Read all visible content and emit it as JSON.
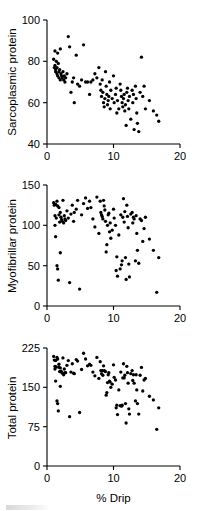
{
  "figure": {
    "name": "drip-vs-protein-scatter-figure",
    "panel_count": 3
  },
  "chart_data": [
    {
      "type": "scatter",
      "title": "",
      "xlabel": "",
      "ylabel": "Sarcoplasmic protein",
      "xlim": [
        0,
        20
      ],
      "ylim": [
        40,
        100
      ],
      "xticks": [
        0,
        10,
        20
      ],
      "yticks": [
        40,
        60,
        80,
        100
      ],
      "xticklabels": [
        "0",
        "10",
        "20"
      ],
      "yticklabels": [
        "40",
        "60",
        "80",
        "100"
      ],
      "grid": false,
      "legend": null,
      "marker": "filled-circle",
      "marker_color": "#000000",
      "n_points": 104,
      "x": [
        1.0,
        1.1,
        1.2,
        1.2,
        1.3,
        1.3,
        1.4,
        1.5,
        1.5,
        1.6,
        1.6,
        1.7,
        1.8,
        1.8,
        1.9,
        2.0,
        2.0,
        2.1,
        2.2,
        2.3,
        2.4,
        2.5,
        2.6,
        2.7,
        2.8,
        3.0,
        3.2,
        3.4,
        3.6,
        3.8,
        4.0,
        4.1,
        4.4,
        4.6,
        4.9,
        5.2,
        5.5,
        5.8,
        6.1,
        6.4,
        6.6,
        6.9,
        7.2,
        7.5,
        7.8,
        8.0,
        8.1,
        8.2,
        8.3,
        8.4,
        8.5,
        8.6,
        8.7,
        8.8,
        8.9,
        9.0,
        9.1,
        9.2,
        9.3,
        9.4,
        9.5,
        9.6,
        9.8,
        10.0,
        10.1,
        10.3,
        10.4,
        10.5,
        10.6,
        10.8,
        11.0,
        11.1,
        11.2,
        11.3,
        11.4,
        11.5,
        11.6,
        11.7,
        11.8,
        11.9,
        12.0,
        12.1,
        12.2,
        12.3,
        12.4,
        12.6,
        12.8,
        12.9,
        13.0,
        13.1,
        13.3,
        13.4,
        13.5,
        13.6,
        13.8,
        14.0,
        14.2,
        14.4,
        14.6,
        14.8,
        15.4,
        16.0,
        16.5,
        16.8
      ],
      "y": [
        81.0,
        77.0,
        85.0,
        78.0,
        76.0,
        75.0,
        80.0,
        74.0,
        77.0,
        73.0,
        84.0,
        79.0,
        75.0,
        72.0,
        76.0,
        86.0,
        71.0,
        74.0,
        73.0,
        72.0,
        75.0,
        71.0,
        73.0,
        70.0,
        72.0,
        74.0,
        92.0,
        87.0,
        65.0,
        70.0,
        72.0,
        60.0,
        83.0,
        69.0,
        68.0,
        71.0,
        88.0,
        70.0,
        70.0,
        64.0,
        70.0,
        71.0,
        74.0,
        72.0,
        77.0,
        69.0,
        66.0,
        63.0,
        71.0,
        65.0,
        60.0,
        58.0,
        62.0,
        75.0,
        68.0,
        64.0,
        59.0,
        61.0,
        63.0,
        70.0,
        57.0,
        66.0,
        62.0,
        73.0,
        60.0,
        64.0,
        67.0,
        55.0,
        61.0,
        57.0,
        69.0,
        66.0,
        63.0,
        60.0,
        58.0,
        62.0,
        64.0,
        56.0,
        59.0,
        49.0,
        65.0,
        67.0,
        61.0,
        57.0,
        63.0,
        52.0,
        66.0,
        60.0,
        64.0,
        47.0,
        68.0,
        62.0,
        55.0,
        50.0,
        46.0,
        65.0,
        82.0,
        63.0,
        68.0,
        57.0,
        61.0,
        56.0,
        54.0,
        51.0
      ]
    },
    {
      "type": "scatter",
      "title": "",
      "xlabel": "",
      "ylabel": "Myofibrillar protein",
      "xlim": [
        0,
        20
      ],
      "ylim": [
        0,
        150
      ],
      "xticks": [
        0,
        10,
        20
      ],
      "yticks": [
        0,
        50,
        100,
        150
      ],
      "xticklabels": [
        "0",
        "10",
        "20"
      ],
      "yticklabels": [
        "0",
        "50",
        "100",
        "150"
      ],
      "grid": false,
      "legend": null,
      "marker": "filled-circle",
      "marker_color": "#000000",
      "n_points": 104,
      "x": [
        1.0,
        1.1,
        1.2,
        1.2,
        1.3,
        1.3,
        1.4,
        1.5,
        1.5,
        1.6,
        1.6,
        1.7,
        1.8,
        1.8,
        1.9,
        2.0,
        2.0,
        2.1,
        2.2,
        2.3,
        2.4,
        2.5,
        2.6,
        2.7,
        2.8,
        3.0,
        3.2,
        3.4,
        3.6,
        3.8,
        4.0,
        4.1,
        4.4,
        4.6,
        4.9,
        5.2,
        5.5,
        5.8,
        6.1,
        6.4,
        6.6,
        6.9,
        7.2,
        7.5,
        7.8,
        8.0,
        8.1,
        8.2,
        8.3,
        8.4,
        8.5,
        8.6,
        8.7,
        8.8,
        8.9,
        9.0,
        9.1,
        9.2,
        9.3,
        9.4,
        9.5,
        9.6,
        9.8,
        10.0,
        10.1,
        10.3,
        10.4,
        10.5,
        10.6,
        10.8,
        11.0,
        11.1,
        11.2,
        11.3,
        11.4,
        11.5,
        11.6,
        11.7,
        11.8,
        11.9,
        12.0,
        12.1,
        12.2,
        12.3,
        12.4,
        12.6,
        12.8,
        12.9,
        13.0,
        13.1,
        13.3,
        13.4,
        13.5,
        13.6,
        13.8,
        14.0,
        14.2,
        14.4,
        14.6,
        14.8,
        15.4,
        16.0,
        16.5,
        16.8
      ],
      "y": [
        128.0,
        125.0,
        100.0,
        112.0,
        86.0,
        126.0,
        109.0,
        50.0,
        130.0,
        46.0,
        124.0,
        32.0,
        113.0,
        122.0,
        104.0,
        66.0,
        116.0,
        110.0,
        107.0,
        105.0,
        131.0,
        103.0,
        112.0,
        108.0,
        106.0,
        118.0,
        109.0,
        29.0,
        114.0,
        125.0,
        105.0,
        116.0,
        120.0,
        131.0,
        21.0,
        113.0,
        127.0,
        134.0,
        121.0,
        130.0,
        122.0,
        108.0,
        98.0,
        135.0,
        90.0,
        130.0,
        116.0,
        113.0,
        111.0,
        108.0,
        131.0,
        124.0,
        119.0,
        105.0,
        67.0,
        76.0,
        100.0,
        113.0,
        115.0,
        92.0,
        103.0,
        84.0,
        94.0,
        120.0,
        109.0,
        100.0,
        44.0,
        61.0,
        37.0,
        88.0,
        46.0,
        113.0,
        51.0,
        56.0,
        110.0,
        133.0,
        104.0,
        117.0,
        60.0,
        33.0,
        125.0,
        111.0,
        97.0,
        52.0,
        36.0,
        114.0,
        116.0,
        103.0,
        110.0,
        108.0,
        56.0,
        112.0,
        90.0,
        69.0,
        53.0,
        108.0,
        106.0,
        80.0,
        96.0,
        110.0,
        83.0,
        69.0,
        17.0,
        60.0
      ]
    },
    {
      "type": "scatter",
      "title": "",
      "xlabel": "% Drip",
      "ylabel": "Total protein",
      "xlim": [
        0,
        20
      ],
      "ylim": [
        0,
        225
      ],
      "xticks": [
        0,
        10,
        20
      ],
      "yticks": [
        0,
        75,
        150,
        225
      ],
      "xticklabels": [
        "0",
        "10",
        "20"
      ],
      "yticklabels": [
        "0",
        "75",
        "150",
        "225"
      ],
      "grid": false,
      "legend": null,
      "marker": "filled-circle",
      "marker_color": "#000000",
      "n_points": 104,
      "x": [
        1.0,
        1.1,
        1.2,
        1.2,
        1.3,
        1.3,
        1.4,
        1.5,
        1.5,
        1.6,
        1.6,
        1.7,
        1.8,
        1.8,
        1.9,
        2.0,
        2.0,
        2.1,
        2.2,
        2.3,
        2.4,
        2.5,
        2.6,
        2.7,
        2.8,
        3.0,
        3.2,
        3.4,
        3.6,
        3.8,
        4.0,
        4.1,
        4.4,
        4.6,
        4.9,
        5.2,
        5.5,
        5.8,
        6.1,
        6.4,
        6.6,
        6.9,
        7.2,
        7.5,
        7.8,
        8.0,
        8.1,
        8.2,
        8.3,
        8.4,
        8.5,
        8.6,
        8.7,
        8.8,
        8.9,
        9.0,
        9.1,
        9.2,
        9.3,
        9.4,
        9.5,
        9.6,
        9.8,
        10.0,
        10.1,
        10.3,
        10.4,
        10.5,
        10.6,
        10.8,
        11.0,
        11.1,
        11.2,
        11.3,
        11.4,
        11.5,
        11.6,
        11.7,
        11.8,
        11.9,
        12.0,
        12.1,
        12.2,
        12.3,
        12.4,
        12.6,
        12.8,
        12.9,
        13.0,
        13.1,
        13.3,
        13.4,
        13.5,
        13.6,
        13.8,
        14.0,
        14.2,
        14.4,
        14.6,
        14.8,
        15.4,
        16.0,
        16.5,
        16.8
      ],
      "y": [
        209.0,
        202.0,
        185.0,
        190.0,
        162.0,
        201.0,
        189.0,
        124.0,
        207.0,
        119.0,
        204.0,
        105.0,
        188.0,
        194.0,
        180.0,
        152.0,
        187.0,
        181.0,
        179.0,
        177.0,
        206.0,
        174.0,
        185.0,
        178.0,
        178.0,
        192.0,
        201.0,
        94.0,
        179.0,
        195.0,
        177.0,
        176.0,
        203.0,
        200.0,
        102.0,
        184.0,
        215.0,
        204.0,
        191.0,
        194.0,
        192.0,
        179.0,
        172.0,
        207.0,
        167.0,
        199.0,
        182.0,
        176.0,
        182.0,
        173.0,
        191.0,
        182.0,
        181.0,
        180.0,
        135.0,
        140.0,
        159.0,
        174.0,
        178.0,
        162.0,
        160.0,
        150.0,
        156.0,
        193.0,
        169.0,
        164.0,
        111.0,
        116.0,
        98.0,
        145.0,
        115.0,
        179.0,
        114.0,
        116.0,
        168.0,
        195.0,
        168.0,
        173.0,
        119.0,
        82.0,
        190.0,
        178.0,
        158.0,
        109.0,
        99.0,
        176.0,
        182.0,
        163.0,
        174.0,
        158.0,
        124.0,
        174.0,
        145.0,
        119.0,
        99.0,
        173.0,
        188.0,
        143.0,
        164.0,
        167.0,
        133.0,
        126.0,
        70.0,
        111.0
      ]
    }
  ]
}
